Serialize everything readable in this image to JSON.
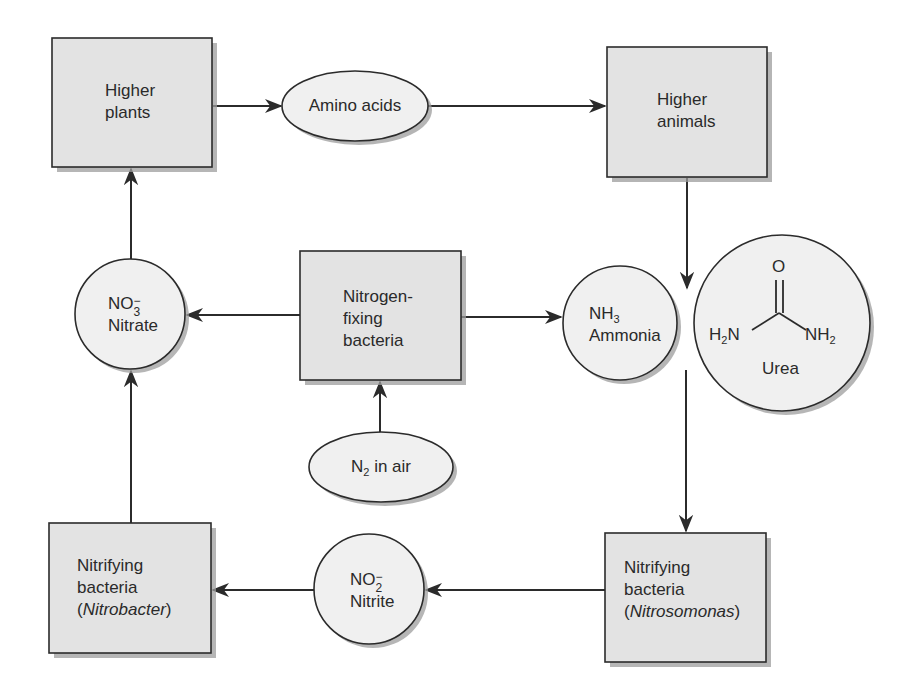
{
  "diagram": {
    "colors": {
      "box_fill": "#e3e3e3",
      "circle_fill": "#f0f0f0",
      "stroke": "#2b2b2b",
      "shadow": "#9a9a9a",
      "background": "#ffffff"
    },
    "nodes": {
      "higher_plants": {
        "shape": "box",
        "line1": "Higher",
        "line2": "plants"
      },
      "amino_acids": {
        "shape": "ellipse",
        "label": "Amino acids"
      },
      "higher_animals": {
        "shape": "box",
        "line1": "Higher",
        "line2": "animals"
      },
      "nitrate": {
        "shape": "circle",
        "formula_base": "NO",
        "formula_sub": "3",
        "formula_sup": "−",
        "name": "Nitrate"
      },
      "nitrogen_fixing": {
        "shape": "box",
        "line1": "Nitrogen-",
        "line2": "fixing",
        "line3": "bacteria"
      },
      "ammonia": {
        "shape": "circle",
        "formula_base": "NH",
        "formula_sub": "3",
        "name": "Ammonia"
      },
      "urea": {
        "shape": "circle",
        "top_atom": "O",
        "left_group_base": "H",
        "left_group_sub": "2",
        "left_group_tail": "N",
        "right_group_base": "NH",
        "right_group_sub": "2",
        "name": "Urea"
      },
      "n2_in_air": {
        "shape": "ellipse",
        "formula_base": "N",
        "formula_sub": "2",
        "suffix": " in air"
      },
      "nitrobacter": {
        "shape": "box",
        "line1": "Nitrifying",
        "line2": "bacteria",
        "paren_open": "(",
        "genus": "Nitrobacter",
        "paren_close": ")"
      },
      "nitrite": {
        "shape": "circle",
        "formula_base": "NO",
        "formula_sub": "2",
        "formula_sup": "−",
        "name": "Nitrite"
      },
      "nitrosomonas": {
        "shape": "box",
        "line1": "Nitrifying",
        "line2": "bacteria",
        "paren_open": "(",
        "genus": "Nitrosomonas",
        "paren_close": ")"
      }
    },
    "edges": [
      {
        "from": "higher_plants",
        "to": "amino_acids"
      },
      {
        "from": "amino_acids",
        "to": "higher_animals"
      },
      {
        "from": "higher_animals",
        "to": "ammonia_urea"
      },
      {
        "from": "nitrogen_fixing",
        "to": "nitrate"
      },
      {
        "from": "nitrogen_fixing",
        "to": "ammonia"
      },
      {
        "from": "n2_in_air",
        "to": "nitrogen_fixing"
      },
      {
        "from": "ammonia_urea",
        "to": "nitrosomonas"
      },
      {
        "from": "nitrosomonas",
        "to": "nitrite"
      },
      {
        "from": "nitrite",
        "to": "nitrobacter"
      },
      {
        "from": "nitrobacter",
        "to": "nitrate"
      },
      {
        "from": "nitrate",
        "to": "higher_plants"
      }
    ]
  }
}
